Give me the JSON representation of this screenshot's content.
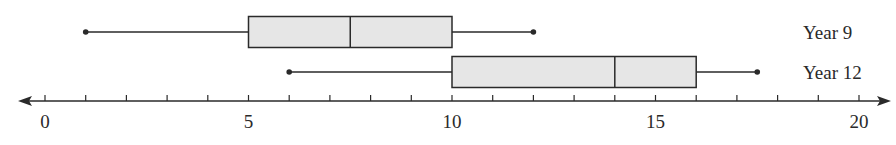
{
  "chart_data": {
    "type": "boxplot",
    "title": "",
    "xlabel": "",
    "ylabel": "",
    "xlim": [
      0,
      20
    ],
    "major_ticks": [
      0,
      5,
      10,
      15,
      20
    ],
    "tick_labels": [
      "0",
      "5",
      "10",
      "15",
      "20"
    ],
    "minor_tick_step": 1,
    "grid": false,
    "box_fill": "#e6e6e6",
    "line_color": "#2a2a2a",
    "series": [
      {
        "name": "Year 9",
        "min": 1,
        "q1": 5,
        "median": 7.5,
        "q3": 10,
        "max": 12
      },
      {
        "name": "Year 12",
        "min": 6,
        "q1": 10,
        "median": 14,
        "q3": 16,
        "max": 17.5
      }
    ]
  }
}
